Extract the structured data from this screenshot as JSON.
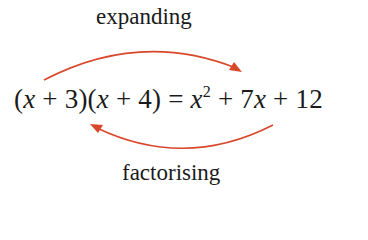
{
  "diagram": {
    "top_label": "expanding",
    "bottom_label": "factorising",
    "equation": {
      "left_side": [
        "(",
        "x",
        " + 3)(",
        "x",
        " + 4)"
      ],
      "equals": " = ",
      "right_side_parts": [
        "x",
        "2",
        " + 7",
        "x",
        " + 12"
      ]
    },
    "arrow_color": "#d9472b",
    "arrows": [
      {
        "name": "expanding-arrow",
        "direction": "left-to-right",
        "position": "above"
      },
      {
        "name": "factorising-arrow",
        "direction": "right-to-left",
        "position": "below"
      }
    ]
  }
}
